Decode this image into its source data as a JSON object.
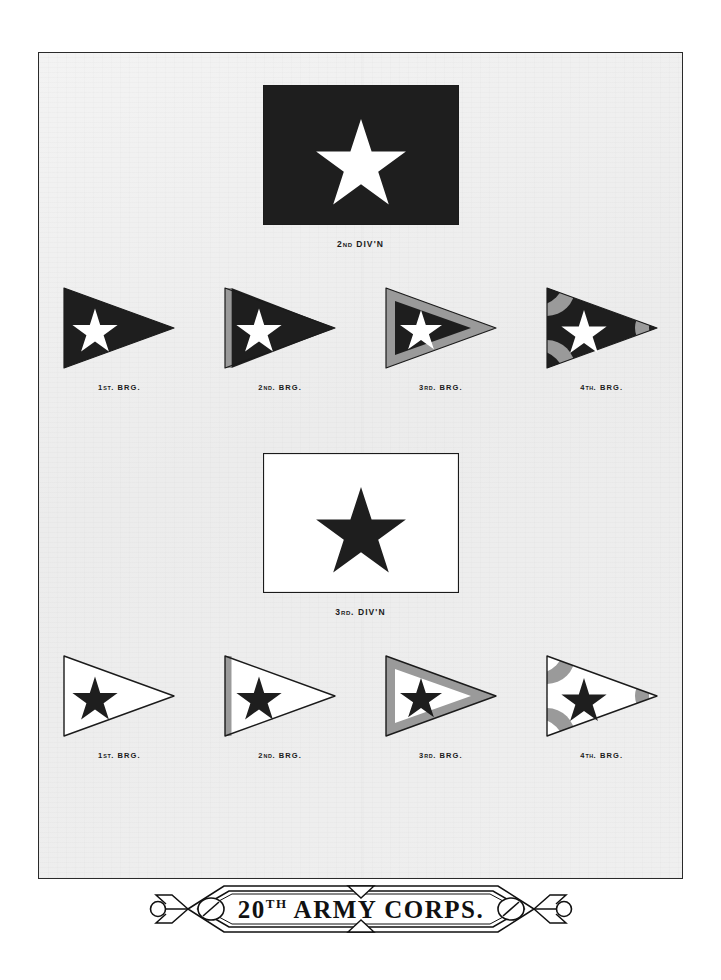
{
  "plate": {
    "title": "20TH ARMY CORPS.",
    "background_color": "#eeeeee",
    "border_color": "#2a2a2a"
  },
  "colors": {
    "dark": "#1e1e1e",
    "white": "#ffffff",
    "gray": "#9a9a9a",
    "gray_light": "#b3b3b3",
    "gray_dark": "#7d7d7d",
    "outline": "#1b1b1b"
  },
  "divisions": [
    {
      "id": "2nd-division",
      "caption_main": "2",
      "caption_small": "ND",
      "caption_rest": " DIV'N",
      "caption_full": "2ND DIV'N",
      "field_color": "#1e1e1e",
      "star_color": "#ffffff",
      "border_color": "#1b1b1b",
      "brigades": [
        {
          "id": "2nd-div-1st-brigade",
          "num": "1",
          "ord": "ST",
          "rest": ". BRG.",
          "caption_full": "1ST. BRG.",
          "field_color": "#1e1e1e",
          "star_color": "#ffffff",
          "device": "plain"
        },
        {
          "id": "2nd-div-2nd-brigade",
          "num": "2",
          "ord": "ND",
          "rest": ". BRG.",
          "caption_full": "2ND. BRG.",
          "field_color": "#1e1e1e",
          "star_color": "#ffffff",
          "device": "hoist-stripe",
          "device_color": "#9a9a9a"
        },
        {
          "id": "2nd-div-3rd-brigade",
          "num": "3",
          "ord": "RD",
          "rest": ". BRG.",
          "caption_full": "3RD. BRG.",
          "field_color": "#1e1e1e",
          "star_color": "#ffffff",
          "device": "border",
          "device_color": "#9a9a9a"
        },
        {
          "id": "2nd-div-4th-brigade",
          "num": "4",
          "ord": "TH",
          "rest": ". BRG.",
          "caption_full": "4TH. BRG.",
          "field_color": "#1e1e1e",
          "star_color": "#ffffff",
          "device": "corner-wedges",
          "device_color": "#9a9a9a"
        }
      ]
    },
    {
      "id": "3rd-division",
      "caption_main": "3",
      "caption_small": "RD",
      "caption_rest": ". DIV'N",
      "caption_full": "3RD. DIV'N",
      "field_color": "#ffffff",
      "star_color": "#1e1e1e",
      "border_color": "#1b1b1b",
      "brigades": [
        {
          "id": "3rd-div-1st-brigade",
          "num": "1",
          "ord": "ST",
          "rest": ". BRG.",
          "caption_full": "1ST. BRG.",
          "field_color": "#ffffff",
          "star_color": "#1e1e1e",
          "device": "plain"
        },
        {
          "id": "3rd-div-2nd-brigade",
          "num": "2",
          "ord": "ND",
          "rest": ". BRG.",
          "caption_full": "2ND. BRG.",
          "field_color": "#ffffff",
          "star_color": "#1e1e1e",
          "device": "hoist-stripe",
          "device_color": "#9a9a9a"
        },
        {
          "id": "3rd-div-3rd-brigade",
          "num": "3",
          "ord": "RD",
          "rest": ". BRG.",
          "caption_full": "3RD. BRG.",
          "field_color": "#ffffff",
          "star_color": "#1e1e1e",
          "device": "border",
          "device_color": "#9a9a9a"
        },
        {
          "id": "3rd-div-4th-brigade",
          "num": "4",
          "ord": "TH",
          "rest": ". BRG.",
          "caption_full": "4TH. BRG.",
          "field_color": "#ffffff",
          "star_color": "#1e1e1e",
          "device": "corner-wedges",
          "device_color": "#9a9a9a"
        }
      ]
    }
  ],
  "banner": {
    "num": "20",
    "ord": "TH",
    "rest": "ARMY  CORPS.",
    "full_text": "20TH ARMY CORPS.",
    "ink_color": "#111111"
  }
}
